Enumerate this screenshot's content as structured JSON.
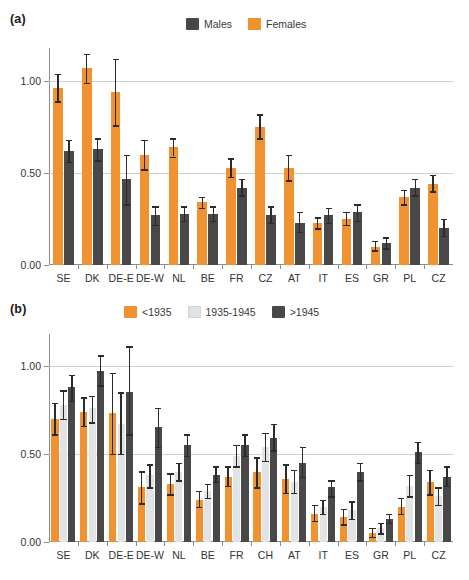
{
  "figure": {
    "width": 469,
    "height": 580,
    "background": "#ffffff"
  },
  "colors": {
    "orange": "#F0922F",
    "light_gray": "#E2E3E5",
    "dark_gray": "#484848",
    "axis": "#8c8c8c",
    "grid": "#cfcfcf",
    "error": "#2b2b2b",
    "text": "#333333"
  },
  "panel_a": {
    "label": "(a)",
    "legend": [
      {
        "label": "Males",
        "color": "#484848"
      },
      {
        "label": "Females",
        "color": "#F0922F"
      }
    ]
  },
  "panel_b": {
    "label": "(b)",
    "legend": [
      {
        "label": "<1935",
        "color": "#F0922F"
      },
      {
        "label": "1935-1945",
        "color": "#E2E3E5"
      },
      {
        "label": ">1945",
        "color": "#484848"
      }
    ]
  },
  "chart_data": [
    {
      "type": "bar",
      "panel": "(a)",
      "title": "",
      "xlabel": "",
      "ylabel": "",
      "ylim": [
        0.0,
        1.18
      ],
      "yticks": [
        0.0,
        0.5,
        1.0
      ],
      "ytick_labels": [
        "0.00",
        "0.50",
        "1.00"
      ],
      "grid": true,
      "gridlines_at": [
        0.5,
        1.0
      ],
      "legend_position": "top-center",
      "categories": [
        "SE",
        "DK",
        "DE-E",
        "DE-W",
        "NL",
        "BE",
        "FR",
        "CZ",
        "AT",
        "IT",
        "ES",
        "GR",
        "PL",
        "CZ"
      ],
      "series": [
        {
          "name": "Females",
          "color": "#F0922F",
          "values": [
            0.96,
            1.07,
            0.94,
            0.6,
            0.64,
            0.34,
            0.53,
            0.75,
            0.53,
            0.23,
            0.25,
            0.1,
            0.37,
            0.44
          ],
          "err_low": [
            0.89,
            0.99,
            0.76,
            0.52,
            0.59,
            0.31,
            0.48,
            0.69,
            0.46,
            0.2,
            0.22,
            0.08,
            0.33,
            0.4
          ],
          "err_high": [
            1.04,
            1.15,
            1.12,
            0.68,
            0.69,
            0.37,
            0.58,
            0.82,
            0.6,
            0.26,
            0.29,
            0.13,
            0.41,
            0.49
          ]
        },
        {
          "name": "Males",
          "color": "#484848",
          "values": [
            0.62,
            0.63,
            0.47,
            0.27,
            0.28,
            0.28,
            0.42,
            0.27,
            0.23,
            0.27,
            0.29,
            0.12,
            0.42,
            0.2
          ],
          "err_low": [
            0.56,
            0.57,
            0.33,
            0.22,
            0.24,
            0.24,
            0.38,
            0.23,
            0.18,
            0.23,
            0.24,
            0.09,
            0.38,
            0.16
          ],
          "err_high": [
            0.68,
            0.69,
            0.6,
            0.32,
            0.32,
            0.32,
            0.47,
            0.32,
            0.29,
            0.31,
            0.33,
            0.15,
            0.47,
            0.25
          ]
        }
      ]
    },
    {
      "type": "bar",
      "panel": "(b)",
      "title": "",
      "xlabel": "",
      "ylabel": "",
      "ylim": [
        0.0,
        1.18
      ],
      "yticks": [
        0.0,
        0.5,
        1.0
      ],
      "ytick_labels": [
        "0.00",
        "0.50",
        "1.00"
      ],
      "grid": true,
      "gridlines_at": [
        0.5,
        1.0
      ],
      "legend_position": "top-center",
      "categories": [
        "SE",
        "DK",
        "DE-E",
        "DE-W",
        "NL",
        "BE",
        "FR",
        "CH",
        "AT",
        "IT",
        "ES",
        "GR",
        "PL",
        "CZ"
      ],
      "series": [
        {
          "name": "<1935",
          "color": "#F0922F",
          "values": [
            0.7,
            0.74,
            0.73,
            0.31,
            0.33,
            0.24,
            0.37,
            0.4,
            0.36,
            0.16,
            0.14,
            0.05,
            0.2,
            0.34
          ],
          "err_low": [
            0.61,
            0.66,
            0.5,
            0.22,
            0.27,
            0.2,
            0.32,
            0.31,
            0.28,
            0.12,
            0.1,
            0.03,
            0.16,
            0.27
          ],
          "err_high": [
            0.79,
            0.82,
            0.96,
            0.4,
            0.39,
            0.29,
            0.43,
            0.48,
            0.44,
            0.21,
            0.19,
            0.08,
            0.25,
            0.41
          ]
        },
        {
          "name": "1935-1945",
          "color": "#E2E3E5",
          "values": [
            0.78,
            0.76,
            0.67,
            0.38,
            0.4,
            0.29,
            0.49,
            0.54,
            0.34,
            0.2,
            0.18,
            0.08,
            0.32,
            0.26
          ],
          "err_low": [
            0.7,
            0.68,
            0.5,
            0.31,
            0.35,
            0.25,
            0.43,
            0.46,
            0.28,
            0.16,
            0.13,
            0.05,
            0.26,
            0.21
          ],
          "err_high": [
            0.86,
            0.83,
            0.85,
            0.44,
            0.45,
            0.33,
            0.55,
            0.62,
            0.41,
            0.24,
            0.23,
            0.11,
            0.38,
            0.31
          ]
        },
        {
          "name": ">1945",
          "color": "#484848",
          "values": [
            0.88,
            0.97,
            0.85,
            0.65,
            0.55,
            0.38,
            0.55,
            0.59,
            0.45,
            0.31,
            0.4,
            0.13,
            0.51,
            0.37
          ],
          "err_low": [
            0.8,
            0.89,
            0.61,
            0.54,
            0.49,
            0.34,
            0.49,
            0.52,
            0.37,
            0.26,
            0.35,
            0.11,
            0.45,
            0.32
          ],
          "err_high": [
            0.95,
            1.06,
            1.11,
            0.76,
            0.61,
            0.43,
            0.61,
            0.67,
            0.54,
            0.35,
            0.45,
            0.16,
            0.57,
            0.43
          ]
        }
      ]
    }
  ]
}
